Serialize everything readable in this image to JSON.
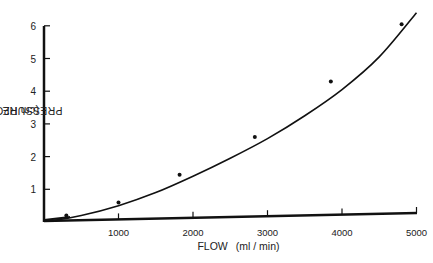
{
  "chart_data": {
    "type": "scatter",
    "title": "",
    "xlabel": "FLOW",
    "xlabel_units": "(ml / min)",
    "ylabel": "PRESSURE DROP",
    "ylabel_units": "(cm H2O)",
    "xlim": [
      0,
      5000
    ],
    "ylim": [
      0,
      6
    ],
    "x_ticks": [
      1000,
      2000,
      3000,
      4000,
      5000
    ],
    "x_tick_labels": [
      "1000",
      "2000",
      "3000",
      "4000",
      "5000"
    ],
    "y_ticks": [
      1,
      2,
      3,
      4,
      5,
      6
    ],
    "y_tick_labels": [
      "1",
      "2",
      "3",
      "4",
      "5",
      "6"
    ],
    "grid": false,
    "legend": null,
    "series": [
      {
        "name": "measured",
        "style": "points",
        "x": [
          300,
          1000,
          1820,
          2830,
          3850,
          4800
        ],
        "y": [
          0.15,
          0.55,
          1.4,
          2.55,
          4.25,
          6.0
        ]
      },
      {
        "name": "fitted curve",
        "style": "smooth-line",
        "x": [
          0,
          500,
          1000,
          1500,
          2000,
          2500,
          3000,
          3500,
          4000,
          4500,
          5000
        ],
        "y": [
          0.0,
          0.2,
          0.5,
          0.9,
          1.4,
          1.95,
          2.55,
          3.25,
          4.05,
          5.05,
          6.4
        ]
      }
    ]
  }
}
